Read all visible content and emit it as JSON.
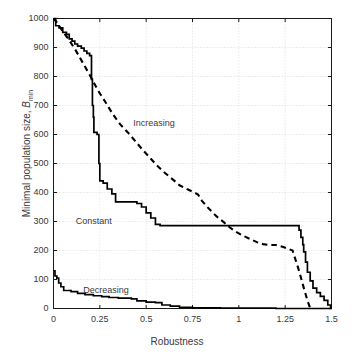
{
  "chart_data": {
    "type": "line",
    "title": "",
    "xlabel": "Robustness",
    "ylabel": "Minimal population size, B_min",
    "ylabel_text": "Minimal population size,",
    "ylabel_symbol": "B",
    "ylabel_subscript": "min",
    "xlim": [
      0,
      1.5
    ],
    "ylim": [
      0,
      1000
    ],
    "xticks": [
      0,
      0.25,
      0.5,
      0.75,
      1,
      1.25,
      1.5
    ],
    "xticklabels": [
      "0",
      "0.25",
      "0.5",
      "0.75",
      "1",
      "1.25",
      "1.5"
    ],
    "yticks": [
      0,
      100,
      200,
      300,
      400,
      500,
      600,
      700,
      800,
      900,
      1000
    ],
    "yticklabels": [
      "0",
      "100",
      "200",
      "300",
      "400",
      "500",
      "600",
      "700",
      "800",
      "900",
      "1000"
    ],
    "grid": true,
    "grid_style": "dotted",
    "legend": "inline-annotations",
    "annotations": [
      {
        "text": "Increasing",
        "x": 0.43,
        "y": 635
      },
      {
        "text": "Constant",
        "x": 0.12,
        "y": 297
      },
      {
        "text": "Decreasing",
        "x": 0.16,
        "y": 62
      }
    ],
    "series": [
      {
        "name": "Increasing",
        "style": "dashed",
        "color": "#000000",
        "points": [
          [
            0.0,
            1000
          ],
          [
            0.02,
            985
          ],
          [
            0.05,
            955
          ],
          [
            0.08,
            930
          ],
          [
            0.12,
            890
          ],
          [
            0.16,
            845
          ],
          [
            0.2,
            800
          ],
          [
            0.24,
            752
          ],
          [
            0.28,
            712
          ],
          [
            0.32,
            670
          ],
          [
            0.36,
            635
          ],
          [
            0.4,
            608
          ],
          [
            0.44,
            578
          ],
          [
            0.48,
            548
          ],
          [
            0.52,
            520
          ],
          [
            0.56,
            492
          ],
          [
            0.6,
            468
          ],
          [
            0.64,
            447
          ],
          [
            0.68,
            425
          ],
          [
            0.72,
            412
          ],
          [
            0.76,
            400
          ],
          [
            0.78,
            393
          ],
          [
            0.8,
            372
          ],
          [
            0.83,
            350
          ],
          [
            0.86,
            330
          ],
          [
            0.89,
            312
          ],
          [
            0.92,
            297
          ],
          [
            0.95,
            280
          ],
          [
            0.98,
            266
          ],
          [
            1.02,
            252
          ],
          [
            1.06,
            240
          ],
          [
            1.1,
            228
          ],
          [
            1.13,
            222
          ],
          [
            1.16,
            219
          ],
          [
            1.2,
            219
          ],
          [
            1.24,
            212
          ],
          [
            1.27,
            205
          ],
          [
            1.29,
            200
          ],
          [
            1.3,
            180
          ],
          [
            1.31,
            160
          ],
          [
            1.32,
            140
          ],
          [
            1.33,
            118
          ],
          [
            1.34,
            95
          ],
          [
            1.35,
            72
          ],
          [
            1.36,
            50
          ],
          [
            1.37,
            28
          ],
          [
            1.38,
            10
          ],
          [
            1.385,
            0
          ]
        ]
      },
      {
        "name": "Constant",
        "style": "solid",
        "color": "#000000",
        "points": [
          [
            0.0,
            1000
          ],
          [
            0.012,
            1000
          ],
          [
            0.012,
            975
          ],
          [
            0.03,
            975
          ],
          [
            0.03,
            968
          ],
          [
            0.05,
            968
          ],
          [
            0.05,
            952
          ],
          [
            0.07,
            952
          ],
          [
            0.07,
            945
          ],
          [
            0.085,
            945
          ],
          [
            0.085,
            930
          ],
          [
            0.1,
            930
          ],
          [
            0.1,
            922
          ],
          [
            0.115,
            922
          ],
          [
            0.115,
            912
          ],
          [
            0.13,
            912
          ],
          [
            0.13,
            905
          ],
          [
            0.15,
            905
          ],
          [
            0.15,
            898
          ],
          [
            0.165,
            898
          ],
          [
            0.165,
            888
          ],
          [
            0.18,
            888
          ],
          [
            0.18,
            880
          ],
          [
            0.195,
            880
          ],
          [
            0.195,
            872
          ],
          [
            0.205,
            872
          ],
          [
            0.205,
            790
          ],
          [
            0.21,
            790
          ],
          [
            0.21,
            700
          ],
          [
            0.215,
            700
          ],
          [
            0.215,
            660
          ],
          [
            0.218,
            660
          ],
          [
            0.218,
            607
          ],
          [
            0.235,
            607
          ],
          [
            0.235,
            600
          ],
          [
            0.245,
            600
          ],
          [
            0.245,
            500
          ],
          [
            0.25,
            500
          ],
          [
            0.25,
            440
          ],
          [
            0.268,
            440
          ],
          [
            0.268,
            432
          ],
          [
            0.29,
            432
          ],
          [
            0.29,
            412
          ],
          [
            0.315,
            412
          ],
          [
            0.315,
            395
          ],
          [
            0.335,
            395
          ],
          [
            0.335,
            368
          ],
          [
            0.45,
            368
          ],
          [
            0.45,
            362
          ],
          [
            0.475,
            362
          ],
          [
            0.475,
            350
          ],
          [
            0.5,
            350
          ],
          [
            0.5,
            330
          ],
          [
            0.525,
            330
          ],
          [
            0.525,
            312
          ],
          [
            0.55,
            312
          ],
          [
            0.55,
            290
          ],
          [
            0.575,
            290
          ],
          [
            0.575,
            286
          ],
          [
            1.325,
            286
          ],
          [
            1.325,
            270
          ],
          [
            1.335,
            270
          ],
          [
            1.335,
            245
          ],
          [
            1.345,
            245
          ],
          [
            1.345,
            220
          ],
          [
            1.35,
            220
          ],
          [
            1.35,
            195
          ],
          [
            1.36,
            195
          ],
          [
            1.36,
            160
          ],
          [
            1.37,
            160
          ],
          [
            1.37,
            125
          ],
          [
            1.385,
            125
          ],
          [
            1.385,
            95
          ],
          [
            1.4,
            95
          ],
          [
            1.4,
            70
          ],
          [
            1.42,
            70
          ],
          [
            1.42,
            55
          ],
          [
            1.44,
            55
          ],
          [
            1.44,
            42
          ],
          [
            1.46,
            42
          ],
          [
            1.46,
            28
          ],
          [
            1.48,
            28
          ],
          [
            1.48,
            12
          ],
          [
            1.495,
            12
          ],
          [
            1.495,
            0
          ],
          [
            1.5,
            0
          ]
        ]
      },
      {
        "name": "Decreasing",
        "style": "solid",
        "color": "#000000",
        "points": [
          [
            0.0,
            130
          ],
          [
            0.008,
            130
          ],
          [
            0.008,
            112
          ],
          [
            0.018,
            112
          ],
          [
            0.018,
            105
          ],
          [
            0.028,
            105
          ],
          [
            0.028,
            88
          ],
          [
            0.04,
            88
          ],
          [
            0.04,
            75
          ],
          [
            0.055,
            75
          ],
          [
            0.055,
            62
          ],
          [
            0.095,
            62
          ],
          [
            0.095,
            58
          ],
          [
            0.13,
            58
          ],
          [
            0.13,
            52
          ],
          [
            0.17,
            52
          ],
          [
            0.17,
            48
          ],
          [
            0.215,
            48
          ],
          [
            0.215,
            44
          ],
          [
            0.26,
            44
          ],
          [
            0.26,
            41
          ],
          [
            0.3,
            41
          ],
          [
            0.3,
            38
          ],
          [
            0.35,
            38
          ],
          [
            0.35,
            36
          ],
          [
            0.42,
            36
          ],
          [
            0.42,
            33
          ],
          [
            0.45,
            33
          ],
          [
            0.45,
            26
          ],
          [
            0.5,
            26
          ],
          [
            0.5,
            22
          ],
          [
            0.55,
            22
          ],
          [
            0.55,
            20
          ],
          [
            0.585,
            20
          ],
          [
            0.585,
            12
          ],
          [
            0.63,
            12
          ],
          [
            0.63,
            8
          ],
          [
            0.68,
            8
          ],
          [
            0.68,
            4
          ],
          [
            0.75,
            4
          ],
          [
            0.75,
            2
          ],
          [
            0.9,
            2
          ],
          [
            0.9,
            1
          ],
          [
            1.2,
            1
          ],
          [
            1.2,
            0
          ],
          [
            1.5,
            0
          ]
        ]
      }
    ]
  },
  "axes": {
    "frame_color": "#1a1a1a",
    "grid_color": "#cfcfcf",
    "background": "#ffffff"
  }
}
